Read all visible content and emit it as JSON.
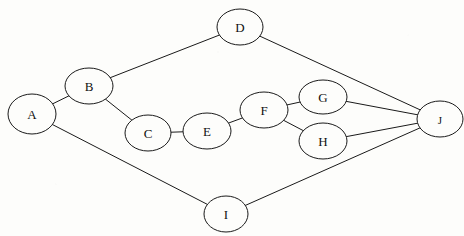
{
  "figure": {
    "type": "node-link-graph",
    "directed": false,
    "background_color": "#fdfdfb",
    "stroke_color": "#1a1a1a",
    "node_fill_color": "#fdfdfb",
    "width": 464,
    "height": 236
  },
  "chart_data": {
    "type": "diagram",
    "title": "",
    "graph_kind": "undirected graph",
    "nodes": [
      {
        "id": "A",
        "label": "A",
        "cx": 32,
        "cy": 114,
        "rx": 24,
        "ry": 20
      },
      {
        "id": "B",
        "label": "B",
        "cx": 89,
        "cy": 86,
        "rx": 24,
        "ry": 18
      },
      {
        "id": "C",
        "label": "C",
        "cx": 148,
        "cy": 133,
        "rx": 23,
        "ry": 18
      },
      {
        "id": "D",
        "label": "D",
        "cx": 240,
        "cy": 27,
        "rx": 23,
        "ry": 18
      },
      {
        "id": "E",
        "label": "E",
        "cx": 207,
        "cy": 131,
        "rx": 24,
        "ry": 18
      },
      {
        "id": "F",
        "label": "F",
        "cx": 264,
        "cy": 110,
        "rx": 24,
        "ry": 18
      },
      {
        "id": "G",
        "label": "G",
        "cx": 323,
        "cy": 97,
        "rx": 24,
        "ry": 17
      },
      {
        "id": "H",
        "label": "H",
        "cx": 323,
        "cy": 141,
        "rx": 24,
        "ry": 18
      },
      {
        "id": "I",
        "label": "I",
        "cx": 226,
        "cy": 214,
        "rx": 22,
        "ry": 18
      },
      {
        "id": "J",
        "label": "J",
        "cx": 440,
        "cy": 119,
        "rx": 23,
        "ry": 18
      }
    ],
    "edges": [
      {
        "source": "A",
        "target": "B"
      },
      {
        "source": "A",
        "target": "I"
      },
      {
        "source": "B",
        "target": "C"
      },
      {
        "source": "B",
        "target": "D"
      },
      {
        "source": "C",
        "target": "E"
      },
      {
        "source": "D",
        "target": "J"
      },
      {
        "source": "E",
        "target": "F"
      },
      {
        "source": "F",
        "target": "G"
      },
      {
        "source": "F",
        "target": "H"
      },
      {
        "source": "G",
        "target": "J"
      },
      {
        "source": "H",
        "target": "J"
      },
      {
        "source": "I",
        "target": "J"
      }
    ],
    "node_count": 10,
    "edge_count": 12
  }
}
